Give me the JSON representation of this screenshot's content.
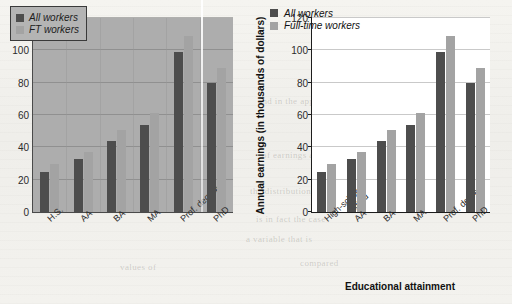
{
  "chart_data": [
    {
      "id": "left",
      "type": "bar",
      "title": "",
      "xlabel": "",
      "ylabel": "",
      "categories": [
        "H.S.",
        "AA",
        "BA",
        "MA",
        "Prof. degree",
        "PhD"
      ],
      "series": [
        {
          "name": "All workers",
          "color": "#4d4d4d",
          "values": [
            25,
            32.5,
            44,
            54,
            99,
            80
          ]
        },
        {
          "name": "FT workers",
          "color": "#a3a3a3",
          "values": [
            30,
            37,
            51,
            61,
            109,
            89
          ]
        }
      ],
      "ylim": [
        0,
        120
      ],
      "yticks": [
        0,
        20,
        40,
        60,
        80,
        100,
        120
      ],
      "grid": true,
      "legend_position": "top-left",
      "plot_background": "#adadad"
    },
    {
      "id": "right",
      "type": "bar",
      "title": "",
      "xlabel": "Educational attainment",
      "ylabel": "Annual earnings (in thousands of dollars)",
      "categories": [
        "High-school grad",
        "AA",
        "BA",
        "MA",
        "Prof. degree",
        "PhD"
      ],
      "category_lines": [
        [
          "High-school",
          "grad"
        ],
        [
          "AA"
        ],
        [
          "BA"
        ],
        [
          "MA"
        ],
        [
          "Prof. degree"
        ],
        [
          "PhD"
        ]
      ],
      "series": [
        {
          "name": "All workers",
          "color": "#4d4d4d",
          "values": [
            25,
            32.5,
            44,
            54,
            99,
            80
          ]
        },
        {
          "name": "Full-time workers",
          "color": "#a3a3a3",
          "values": [
            30,
            37,
            51,
            61,
            109,
            89
          ]
        }
      ],
      "ylim": [
        0,
        120
      ],
      "yticks": [
        0,
        20,
        40,
        60,
        80,
        100,
        120
      ],
      "grid": true,
      "legend_position": "top-left",
      "plot_background": "#ffffff"
    }
  ],
  "ghost_text": [
    {
      "text": "and in the appendix",
      "x": 258,
      "y": 96
    },
    {
      "text": "of earnings and",
      "x": 262,
      "y": 150
    },
    {
      "text": "the distribution of",
      "x": 250,
      "y": 186
    },
    {
      "text": "is in fact the case",
      "x": 256,
      "y": 214
    },
    {
      "text": "a variable that is",
      "x": 246,
      "y": 234
    },
    {
      "text": "compared",
      "x": 300,
      "y": 258
    },
    {
      "text": "values of",
      "x": 120,
      "y": 262
    }
  ],
  "colors": {
    "series_dark": "#4d4d4d",
    "series_light": "#a3a3a3",
    "page": "#f2f1ed",
    "axis": "#1d1d1d",
    "grid": "#c9c9c9"
  }
}
